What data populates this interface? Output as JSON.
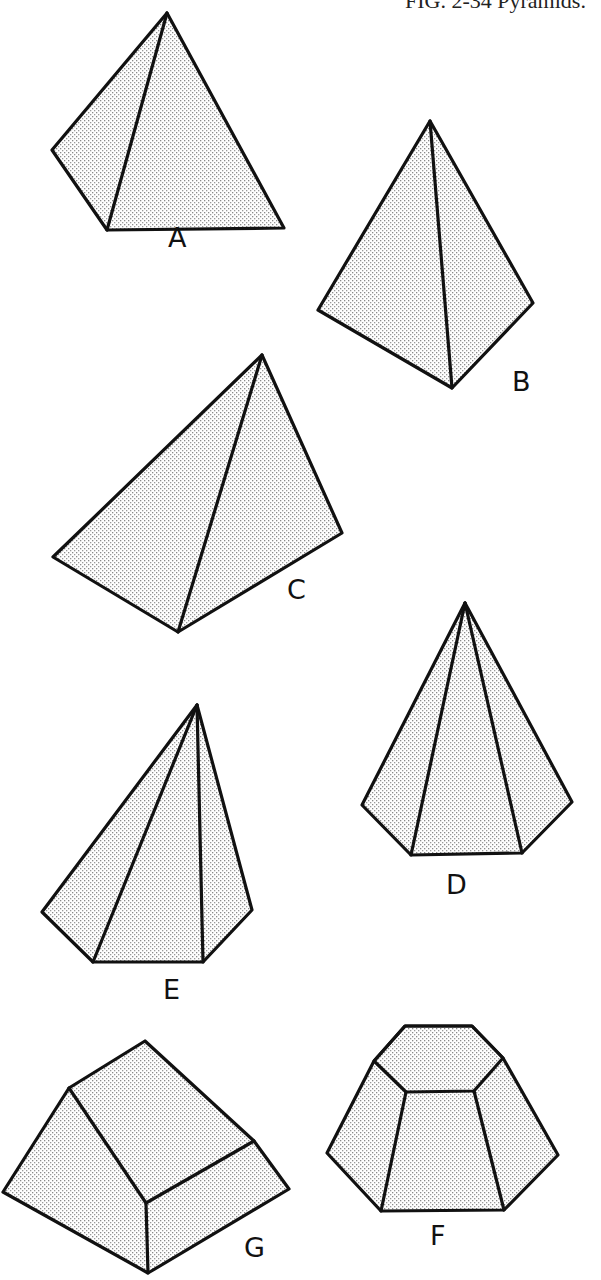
{
  "caption": "FIG. 2-34 Pyramids.",
  "colors": {
    "stroke": "#111111",
    "fill_dot": "#8a8a8a",
    "background": "#ffffff"
  },
  "shapes": [
    {
      "id": "A",
      "label": "A",
      "description": "triangular pyramid"
    },
    {
      "id": "B",
      "label": "B",
      "description": "triangular pyramid"
    },
    {
      "id": "C",
      "label": "C",
      "description": "triangular pyramid"
    },
    {
      "id": "D",
      "label": "D",
      "description": "hexagonal pyramid"
    },
    {
      "id": "E",
      "label": "E",
      "description": "oblique pentagonal pyramid"
    },
    {
      "id": "F",
      "label": "F",
      "description": "frustum of hexagonal pyramid"
    },
    {
      "id": "G",
      "label": "G",
      "description": "truncated wedge pyramid"
    }
  ]
}
